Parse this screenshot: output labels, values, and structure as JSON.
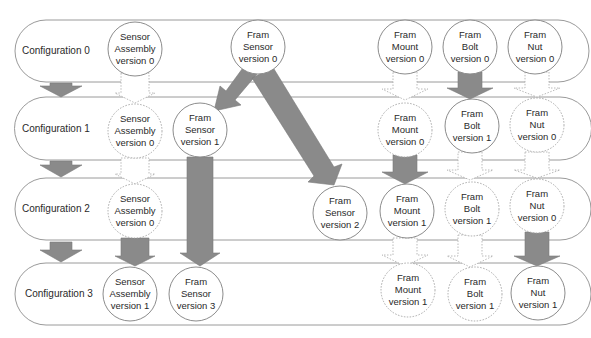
{
  "diagram": {
    "configurations": [
      {
        "label": "Configuration 0"
      },
      {
        "label": "Configuration 1"
      },
      {
        "label": "Configuration 2"
      },
      {
        "label": "Configuration 3"
      }
    ],
    "nodes": {
      "c0_sa": [
        "Sensor",
        "Assembly",
        "version 0"
      ],
      "c0_fs": [
        "Fram",
        "Sensor",
        "version 0"
      ],
      "c0_fm": [
        "Fram",
        "Mount",
        "version 0"
      ],
      "c0_fb": [
        "Fram",
        "Bolt",
        "version 0"
      ],
      "c0_fn": [
        "Fram",
        "Nut",
        "version 0"
      ],
      "c1_sa": [
        "Sensor",
        "Assembly",
        "version 0"
      ],
      "c1_fs": [
        "Fram",
        "Sensor",
        "version 1"
      ],
      "c1_fm": [
        "Fram",
        "Mount",
        "version 0"
      ],
      "c1_fb": [
        "Fram",
        "Bolt",
        "version 1"
      ],
      "c1_fn": [
        "Fram",
        "Nut",
        "version 0"
      ],
      "c2_sa": [
        "Sensor",
        "Assembly",
        "version 0"
      ],
      "c2_fs": [
        "Fram",
        "Sensor",
        "version 2"
      ],
      "c2_fm": [
        "Fram",
        "Mount",
        "version 1"
      ],
      "c2_fb": [
        "Fram",
        "Bolt",
        "version 1"
      ],
      "c2_fn": [
        "Fram",
        "Nut",
        "version 0"
      ],
      "c3_sa": [
        "Sensor",
        "Assembly",
        "version 1"
      ],
      "c3_fs": [
        "Fram",
        "Sensor",
        "version 3"
      ],
      "c3_fm": [
        "Fram",
        "Mount",
        "version 1"
      ],
      "c3_fb": [
        "Fram",
        "Bolt",
        "version 1"
      ],
      "c3_fn": [
        "Fram",
        "Nut",
        "version 1"
      ]
    },
    "colors": {
      "changed_arrow": "#8a8a8a",
      "unchanged_arrow": "#ffffff",
      "outline": "#9a9a9a"
    },
    "legend_semantics": {
      "solid_gray_arrow": "new version",
      "dotted_white_arrow": "version carried over"
    }
  }
}
